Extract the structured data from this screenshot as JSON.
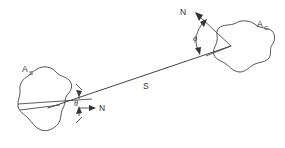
{
  "figure": {
    "title": "",
    "background_color": "#ffffff",
    "stroke_color": "#444444",
    "text_color": "#333333",
    "width": 285,
    "height": 148
  },
  "labels": {
    "source_area": "A",
    "source_area_sub": "S",
    "receiver_area": "A",
    "receiver_area_sub": "C",
    "distance": "S",
    "north_left": "N",
    "north_right": "N",
    "angle_theta": "θ",
    "angle_phi": "ϕ"
  },
  "elements": {
    "source_blob_name": "source-area-blob",
    "receiver_blob_name": "receiver-area-blob",
    "connector_name": "distance-line",
    "theta_arc_name": "theta-angle-arc",
    "phi_arc_name": "phi-angle-arc"
  },
  "geometry": {
    "source_vertex": [
      48,
      108
    ],
    "receiver_vertex": [
      231,
      46
    ],
    "distance_line": [
      [
        48,
        108
      ],
      [
        231,
        46
      ]
    ],
    "north_left_arrow": [
      [
        80,
        108
      ],
      [
        96,
        108
      ]
    ],
    "north_right_arrow": [
      [
        231,
        46
      ],
      [
        196,
        14
      ]
    ],
    "theta_vertex": [
      48,
      108
    ],
    "phi_vertex": [
      231,
      46
    ]
  }
}
